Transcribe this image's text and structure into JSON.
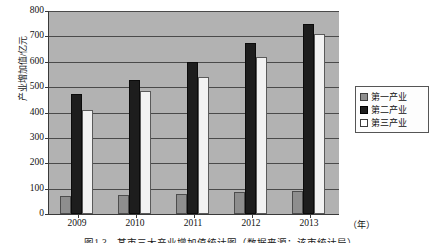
{
  "chart_data": {
    "type": "bar",
    "title": "",
    "xlabel": "（年）",
    "ylabel": "产业增加值/亿元",
    "categories": [
      "2009",
      "2010",
      "2011",
      "2012",
      "2013"
    ],
    "series": [
      {
        "name": "第一产业",
        "values": [
          70,
          75,
          80,
          85,
          92
        ],
        "color": "#8e8e8e"
      },
      {
        "name": "第二产业",
        "values": [
          472,
          530,
          600,
          672,
          750
        ],
        "color": "#1d1d1d"
      },
      {
        "name": "第三产业",
        "values": [
          410,
          483,
          540,
          620,
          710
        ],
        "color": "#f2f2f2"
      }
    ],
    "ylim": [
      0,
      800
    ],
    "yticks": [
      0,
      100,
      200,
      300,
      400,
      500,
      600,
      700,
      800
    ],
    "ytick_labels": [
      "0",
      "100",
      "200",
      "300",
      "400",
      "500",
      "600",
      "700",
      "800"
    ],
    "grid": true,
    "legend_position": "right",
    "plot_background": "#b2b2b2"
  },
  "axis": {
    "y_title": "产业增加值/亿元",
    "x_unit": "（年）"
  },
  "legend": {
    "items": [
      {
        "label": "第一产业"
      },
      {
        "label": "第二产业"
      },
      {
        "label": "第三产业"
      }
    ]
  },
  "caption": {
    "text": "图1-3　某市三大产业增加值统计图（数据来源：该市统计局）"
  }
}
